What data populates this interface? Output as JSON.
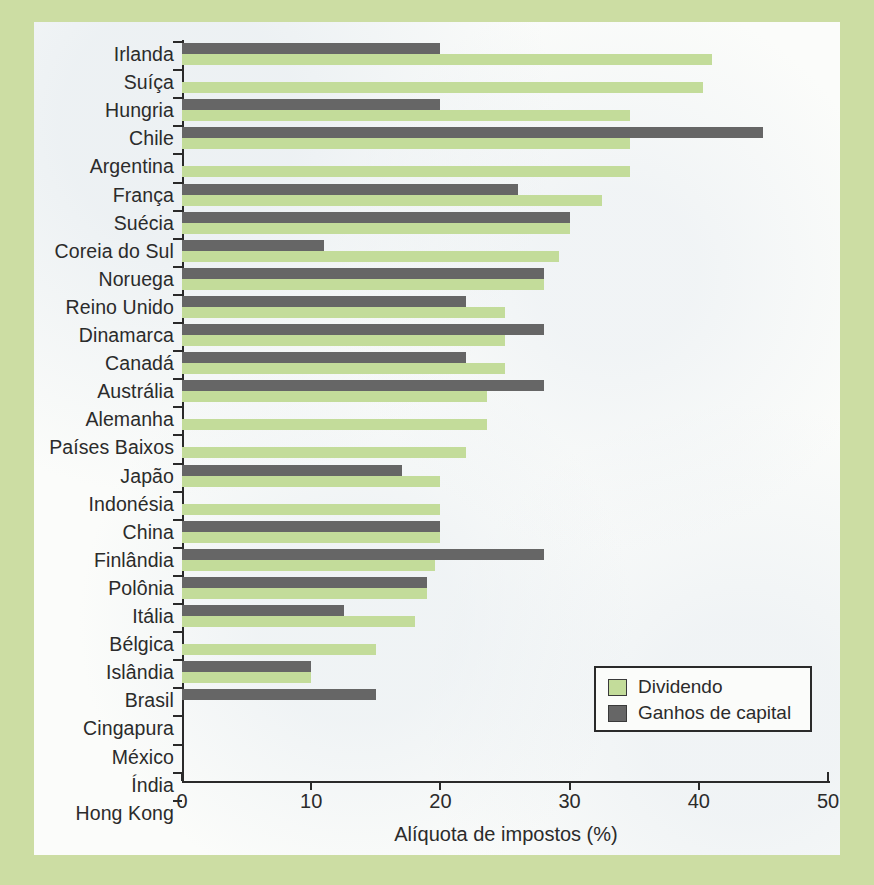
{
  "chart_data": {
    "type": "bar",
    "orientation": "horizontal",
    "title": "",
    "xlabel": "Alíquota de impostos (%)",
    "ylabel": "",
    "xlim": [
      0,
      50
    ],
    "xticks": [
      0,
      10,
      20,
      30,
      40,
      50
    ],
    "xtick_labels": [
      "0",
      "10",
      "20",
      "30",
      "40",
      "50"
    ],
    "grid": false,
    "legend_position": "bottom-right",
    "colors": {
      "dividend": "#c3dc9a",
      "capital": "#666666",
      "axis": "#2a2a2a",
      "panel_background": "#fbfcfa",
      "page_background": "#ccdda3",
      "text": "#2b2b2b"
    },
    "categories": [
      "Irlanda",
      "Suíça",
      "Hungria",
      "Chile",
      "Argentina",
      "França",
      "Suécia",
      "Coreia do Sul",
      "Noruega",
      "Reino Unido",
      "Dinamarca",
      "Canadá",
      "Austrália",
      "Alemanha",
      "Países Baixos",
      "Japão",
      "Indonésia",
      "China",
      "Finlândia",
      "Polônia",
      "Itália",
      "Bélgica",
      "Islândia",
      "Brasil",
      "Cingapura",
      "México",
      "Índia",
      "Hong Kong"
    ],
    "series": [
      {
        "name": "Ganhos de capital",
        "key": "capital",
        "color": "#666666",
        "values": [
          20,
          0,
          20,
          45,
          0,
          26,
          30,
          11,
          28,
          22,
          28,
          22,
          28,
          0,
          0,
          17,
          0,
          20,
          28,
          19,
          12.5,
          0,
          10,
          15,
          0,
          0,
          0,
          0
        ]
      },
      {
        "name": "Dividendo",
        "key": "dividend",
        "color": "#c3dc9a",
        "values": [
          41,
          40.3,
          34.7,
          34.7,
          34.7,
          32.5,
          30,
          29.2,
          28,
          25,
          25,
          25,
          23.6,
          23.6,
          22,
          20,
          20,
          20,
          19.6,
          19,
          18,
          15,
          10,
          0,
          0,
          0,
          0,
          0
        ]
      }
    ]
  },
  "legend": {
    "items": [
      {
        "label": "Dividendo",
        "key": "dividend"
      },
      {
        "label": "Ganhos de capital",
        "key": "capital"
      }
    ]
  },
  "axis": {
    "x_title": "Alíquota de impostos (%)"
  }
}
